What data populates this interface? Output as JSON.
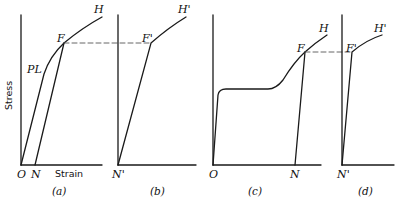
{
  "figure": {
    "panels": [
      {
        "id": "a",
        "caption": "(a)",
        "labels": {
          "origin": "O",
          "N": "N",
          "F": "F",
          "H": "H",
          "PL": "PL",
          "xlabel": "Strain",
          "ylabel": "Stress"
        }
      },
      {
        "id": "b",
        "caption": "(b)",
        "labels": {
          "origin": "N'",
          "F": "F'",
          "H": "H'"
        }
      },
      {
        "id": "c",
        "caption": "(c)",
        "labels": {
          "origin": "O",
          "N": "N",
          "F": "F",
          "H": "H"
        }
      },
      {
        "id": "d",
        "caption": "(d)",
        "labels": {
          "origin": "N'",
          "F": "F'",
          "H": "H'"
        }
      }
    ],
    "line_color": "#1a1a1a",
    "dash_color": "#555555"
  }
}
